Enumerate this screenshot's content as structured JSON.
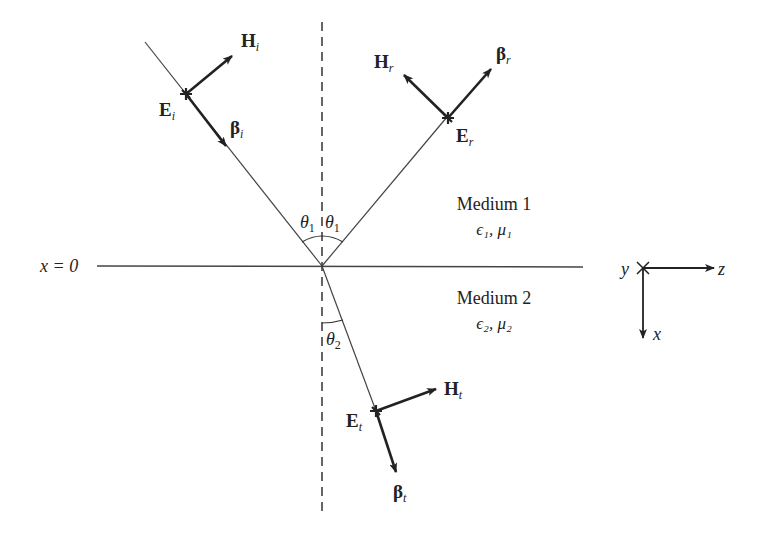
{
  "diagram": {
    "interface_label": "x = 0",
    "medium1": {
      "name": "Medium 1",
      "params": "ϵ₁, μ₁"
    },
    "medium2": {
      "name": "Medium 2",
      "params": "ϵ₂, μ₂"
    },
    "angles": {
      "incident": {
        "sym": "θ",
        "sub": "1"
      },
      "reflected": {
        "sym": "θ",
        "sub": "1"
      },
      "transmitted": {
        "sym": "θ",
        "sub": "2"
      }
    },
    "incident_wave": {
      "E": {
        "sym": "E",
        "sub": "i"
      },
      "H": {
        "sym": "H",
        "sub": "i"
      },
      "beta": {
        "sym": "β",
        "sub": "i"
      }
    },
    "reflected_wave": {
      "E": {
        "sym": "E",
        "sub": "r"
      },
      "H": {
        "sym": "H",
        "sub": "r"
      },
      "beta": {
        "sym": "β",
        "sub": "r"
      }
    },
    "transmitted_wave": {
      "E": {
        "sym": "E",
        "sub": "t"
      },
      "H": {
        "sym": "H",
        "sub": "t"
      },
      "beta": {
        "sym": "β",
        "sub": "t"
      }
    },
    "axes": {
      "y": "y",
      "z": "z",
      "x": "x"
    },
    "colors": {
      "line": "#222222",
      "background": "#ffffff"
    }
  }
}
